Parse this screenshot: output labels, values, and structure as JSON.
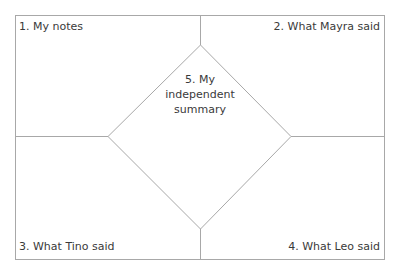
{
  "diagram": {
    "type": "four-square graphic organizer with center diamond",
    "line_color": "#a8a8a8",
    "text_color": "#3a3a3a",
    "quadrants": [
      {
        "position": "top-left",
        "label": "1. My notes"
      },
      {
        "position": "top-right",
        "label": "2. What Mayra said"
      },
      {
        "position": "bottom-left",
        "label": "3. What Tino said"
      },
      {
        "position": "bottom-right",
        "label": "4. What Leo said"
      }
    ],
    "center": {
      "lines": [
        "5. My",
        "independent",
        "summary"
      ]
    }
  }
}
